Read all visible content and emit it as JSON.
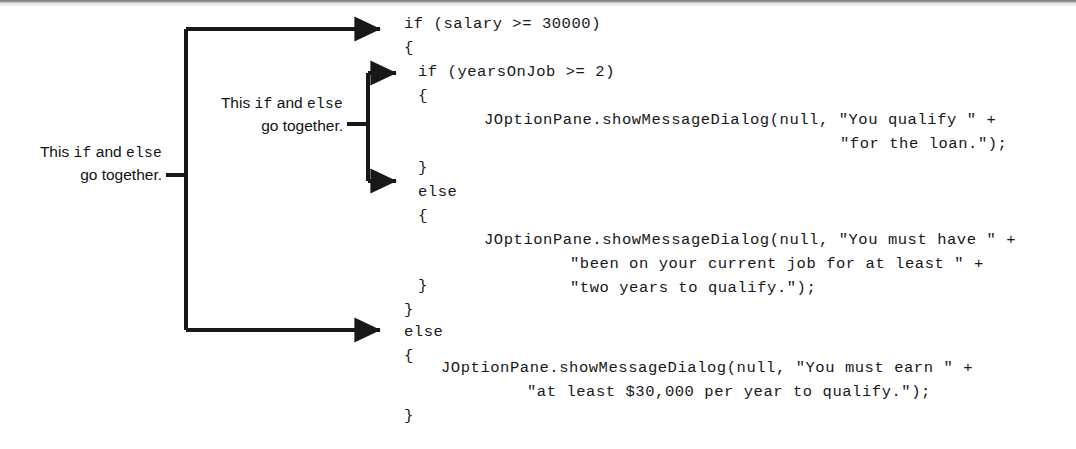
{
  "figure": {
    "kind": "annotated-java-code-listing",
    "language": "Java",
    "ink_color": "#16181a",
    "background_color": "#ffffff"
  },
  "code": {
    "lines": [
      {
        "id": "l1",
        "text": "if (salary >= 30000)",
        "x": 404,
        "y": 14,
        "level": 0
      },
      {
        "id": "l2",
        "text": "{",
        "x": 404,
        "y": 38,
        "level": 0
      },
      {
        "id": "l3",
        "text": "if (yearsOnJob >= 2)",
        "x": 418,
        "y": 62,
        "level": 1
      },
      {
        "id": "l4",
        "text": "{",
        "x": 418,
        "y": 86,
        "level": 1
      },
      {
        "id": "l5",
        "text": "JOptionPane.showMessageDialog(null, \"You qualify \" +",
        "x": 484,
        "y": 110,
        "level": 2
      },
      {
        "id": "l6",
        "text": "\"for the loan.\");",
        "x": 840,
        "y": 134,
        "level": 2
      },
      {
        "id": "l7",
        "text": "}",
        "x": 418,
        "y": 158,
        "level": 1
      },
      {
        "id": "l8",
        "text": "else",
        "x": 418,
        "y": 182,
        "level": 1
      },
      {
        "id": "l9",
        "text": "{",
        "x": 418,
        "y": 206,
        "level": 1
      },
      {
        "id": "l10",
        "text": "JOptionPane.showMessageDialog(null, \"You must have \" +",
        "x": 484,
        "y": 230,
        "level": 2
      },
      {
        "id": "l11",
        "text": "\"been on your current job for at least \" +",
        "x": 570,
        "y": 254,
        "level": 2
      },
      {
        "id": "l12",
        "text": "\"two years to qualify.\");",
        "x": 570,
        "y": 278,
        "level": 2
      },
      {
        "id": "l13",
        "text": "}",
        "x": 418,
        "y": 302,
        "level": 1
      },
      {
        "id": "l14",
        "text": "}",
        "x": 404,
        "y": 302,
        "level": 0
      },
      {
        "id": "l15",
        "text": "else",
        "x": 404,
        "y": 322,
        "level": 0
      },
      {
        "id": "l16",
        "text": "{",
        "x": 404,
        "y": 346,
        "level": 0
      },
      {
        "id": "l17",
        "text": "JOptionPane.showMessageDialog(null, \"You must earn \" +",
        "x": 441,
        "y": 370,
        "level": 1
      },
      {
        "id": "l18",
        "text": "\"at least $30,000 per year to qualify.\");",
        "x": 527,
        "y": 394,
        "level": 1
      },
      {
        "id": "l19",
        "text": "}",
        "x": 404,
        "y": 418,
        "level": 0
      }
    ]
  },
  "callouts": {
    "outer": {
      "id": "outer-pairing-note",
      "line1_prefix": "This ",
      "line1_kw1": "if",
      "line1_middle": " and ",
      "line1_kw2": "else",
      "line2": "go together.",
      "describes": "outer if / outer else"
    },
    "inner": {
      "id": "inner-pairing-note",
      "line1_prefix": "This ",
      "line1_kw1": "if",
      "line1_middle": " and ",
      "line1_kw2": "else",
      "line2": "go together.",
      "describes": "inner if / inner else"
    }
  },
  "connectors": {
    "outer_bracket": {
      "name": "outer-if-else-bracket",
      "spine_x": 186,
      "top_y": 29,
      "bottom_y": 330,
      "arrow_tip_x": 400,
      "tick_y": 175,
      "tick_from_x": 166,
      "stroke": "#16181a",
      "stroke_width": 4
    },
    "inner_bracket": {
      "name": "inner-if-else-bracket",
      "spine_x": 368,
      "top_y": 73,
      "bottom_y": 181,
      "arrow_tip_x": 414,
      "tick_y": 124,
      "tick_from_x": 347,
      "stroke": "#16181a",
      "stroke_width": 4
    }
  }
}
